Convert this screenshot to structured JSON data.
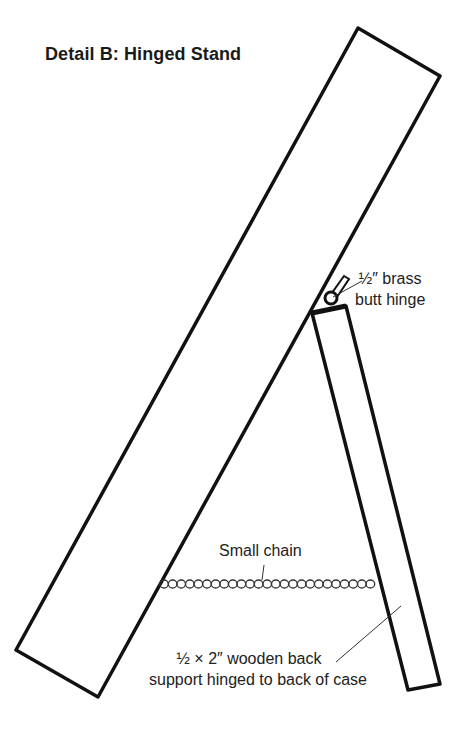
{
  "title": "Detail B: Hinged Stand",
  "labels": {
    "hinge": {
      "line1": "½″ brass",
      "line2": "butt hinge"
    },
    "chain": "Small chain",
    "support": {
      "line1": "½ × 2″ wooden back",
      "line2": "support hinged to back of case"
    }
  },
  "components": [
    "case-board",
    "back-support",
    "brass-butt-hinge",
    "small-chain"
  ],
  "colors": {
    "line": "#111111",
    "background": "#ffffff"
  }
}
